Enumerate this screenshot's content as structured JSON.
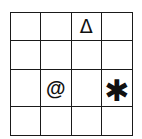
{
  "grid": {
    "rows": 4,
    "cols": 4,
    "cells": [
      [
        "",
        "",
        "Δ",
        ""
      ],
      [
        "",
        "",
        "",
        ""
      ],
      [
        "",
        "@",
        "",
        "✱"
      ],
      [
        "",
        "",
        "",
        ""
      ]
    ],
    "symbols": [
      {
        "row": 0,
        "col": 2,
        "glyph": "Δ",
        "name": "triangle"
      },
      {
        "row": 2,
        "col": 1,
        "glyph": "@",
        "name": "at-sign"
      },
      {
        "row": 2,
        "col": 3,
        "glyph": "✱",
        "name": "asterisk"
      }
    ],
    "line_color": "#1a1a1a"
  }
}
